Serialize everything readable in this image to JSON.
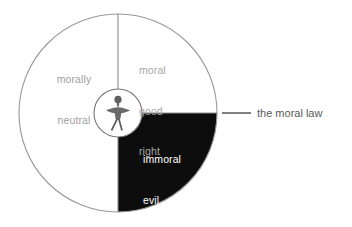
{
  "diagram": {
    "title": "the moral law",
    "outer_circle": {
      "center_x": 118,
      "center_y": 113,
      "radius": 99,
      "stroke_color": "#999999"
    },
    "inner_circle": {
      "center_x": 118,
      "center_y": 113,
      "radius": 24,
      "stroke_color": "#777777"
    },
    "axes": {
      "vertical_color": "#888888",
      "horizontal_color": "#888888"
    },
    "quadrants": [
      {
        "id": "morally-neutral",
        "position": "left-half",
        "fill": "#ffffff",
        "text_color": "#a0a0a0",
        "lines": [
          "morally",
          "neutral"
        ]
      },
      {
        "id": "moral-good-right",
        "position": "upper-right",
        "fill": "#ffffff",
        "text_color": "#a8a8a8",
        "lines": [
          "moral",
          "good",
          "right"
        ]
      },
      {
        "id": "immoral-evil-wrong",
        "position": "lower-right",
        "fill": "#0d0d0d",
        "text_color": "#ffffff",
        "lines": [
          "immoral",
          "evil",
          "wrong"
        ]
      }
    ],
    "center_figure": {
      "id": "human-figure",
      "fill": "#6b6b6b"
    },
    "callout": {
      "label": "the moral law",
      "text_color": "#5a5a5a",
      "leader_line_color": "#4a4a4a",
      "leader_x_start": 222,
      "leader_x_end": 251,
      "leader_y": 113
    }
  }
}
